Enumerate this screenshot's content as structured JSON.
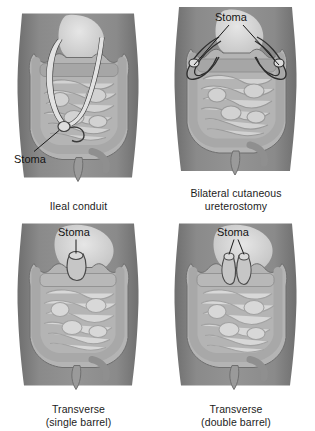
{
  "figure": {
    "panel_count": 4,
    "layout": "2x2 grid"
  },
  "colors": {
    "page_background": "#ffffff",
    "skin": "#8a8a8a",
    "skin_shadow": "#6f6f6f",
    "skin_highlight": "#9b9b9b",
    "abdomen_cavity": "#b4b4b4",
    "intestine_fill": "#d2d2d2",
    "intestine_outline": "#8f8f8f",
    "colon_fill": "#c0c0c0",
    "organ_highlight": "#dcdcdc",
    "ureter_fill": "#e2e2e2",
    "outline_dark": "#4a4a4a",
    "leader_line": "#1a1a1a",
    "label_text": "#141414"
  },
  "panels": [
    {
      "id": "ileal-conduit",
      "position": "top-left",
      "caption": "Ileal conduit",
      "caption_lines": [
        "Ileal conduit"
      ],
      "stoma_label": "Stoma",
      "stoma_label_position": "lower-left",
      "leader_lines": 1,
      "stoma_count": 1,
      "stoma_sites": [
        "right lower quadrant"
      ],
      "features": [
        "two ureters",
        "ileal conduit segment",
        "small intestine",
        "colon",
        "rectum"
      ]
    },
    {
      "id": "bilateral-cutaneous-ureterostomy",
      "position": "top-right",
      "caption": "Bilateral cutaneous ureterostomy",
      "caption_lines": [
        "Bilateral cutaneous",
        "ureterostomy"
      ],
      "stoma_label": "Stoma",
      "stoma_label_position": "top-center",
      "leader_lines": 2,
      "stoma_count": 2,
      "stoma_sites": [
        "left flank",
        "right flank"
      ],
      "features": [
        "two ureters exiting laterally",
        "small intestine",
        "colon",
        "rectum"
      ]
    },
    {
      "id": "transverse-single-barrel",
      "position": "bottom-left",
      "caption": "Transverse (single barrel)",
      "caption_lines": [
        "Transverse",
        "(single barrel)"
      ],
      "stoma_label": "Stoma",
      "stoma_label_position": "top-center",
      "leader_lines": 1,
      "stoma_count": 1,
      "stoma_sites": [
        "transverse colon, upper midline"
      ],
      "features": [
        "transverse colostomy",
        "small intestine",
        "colon"
      ]
    },
    {
      "id": "transverse-double-barrel",
      "position": "bottom-right",
      "caption": "Transverse (double barrel)",
      "caption_lines": [
        "Transverse",
        "(double barrel)"
      ],
      "stoma_label": "Stoma",
      "stoma_label_position": "top-center",
      "leader_lines": 2,
      "stoma_count": 2,
      "stoma_sites": [
        "proximal limb",
        "distal limb"
      ],
      "features": [
        "double barrel transverse colostomy",
        "small intestine",
        "colon"
      ]
    }
  ]
}
